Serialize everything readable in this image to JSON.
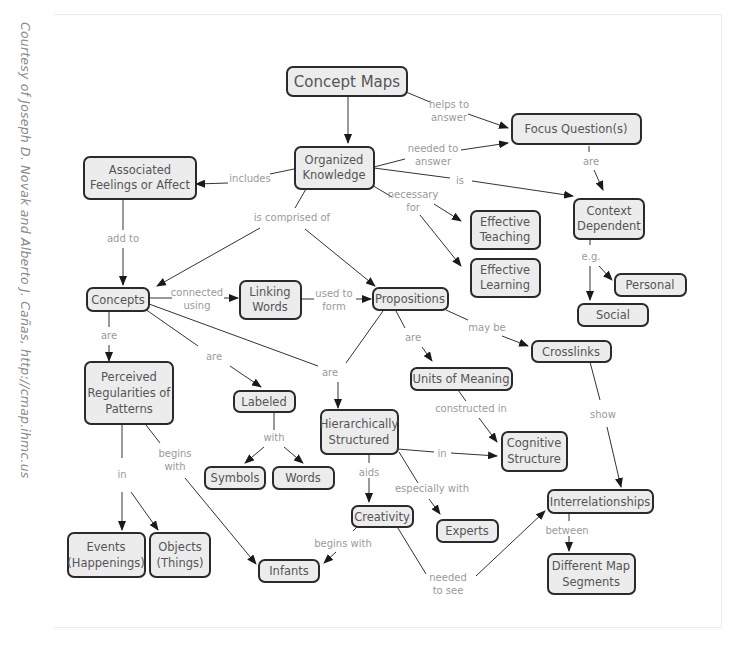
{
  "credit": "Courtesy of Joseph D. Novak and Alberto J. Cañas, http://cmap.ihmc.us",
  "nodes": {
    "concept_maps": [
      "Concept Maps"
    ],
    "focus_questions": [
      "Focus Question(s)"
    ],
    "organized_knowledge": [
      "Organized",
      "Knowledge"
    ],
    "associated_feelings": [
      "Associated",
      "Feelings or Affect"
    ],
    "context_dependent": [
      "Context",
      "Dependent"
    ],
    "effective_teaching": [
      "Effective",
      "Teaching"
    ],
    "effective_learning": [
      "Effective",
      "Learning"
    ],
    "personal": [
      "Personal"
    ],
    "social": [
      "Social"
    ],
    "concepts": [
      "Concepts"
    ],
    "linking_words": [
      "Linking",
      "Words"
    ],
    "propositions": [
      "Propositions"
    ],
    "crosslinks": [
      "Crosslinks"
    ],
    "perceived_regularities": [
      "Perceived",
      "Regularities of",
      "Patterns"
    ],
    "labeled": [
      "Labeled"
    ],
    "units_of_meaning": [
      "Units of Meaning"
    ],
    "hierarchically_structured": [
      "Hierarchically",
      "Structured"
    ],
    "cognitive_structure": [
      "Cognitive",
      "Structure"
    ],
    "symbols": [
      "Symbols"
    ],
    "words": [
      "Words"
    ],
    "interrelationships": [
      "Interrelationships"
    ],
    "creativity": [
      "Creativity"
    ],
    "experts": [
      "Experts"
    ],
    "events": [
      "Events",
      "(Happenings)"
    ],
    "objects": [
      "Objects",
      "(Things)"
    ],
    "infants": [
      "Infants"
    ],
    "different_map_segments": [
      "Different Map",
      "Segments"
    ]
  },
  "links": {
    "helps_to_answer": [
      "helps to",
      "answer"
    ],
    "needed_to_answer": [
      "needed to",
      "answer"
    ],
    "includes": [
      "includes"
    ],
    "is": [
      "is"
    ],
    "are_focus": [
      "are"
    ],
    "necessary_for": [
      "necessary",
      "for"
    ],
    "is_comprised_of": [
      "is comprised of"
    ],
    "add_to": [
      "add to"
    ],
    "eg": [
      "e.g."
    ],
    "connected_using": [
      "connected",
      "using"
    ],
    "used_to_form": [
      "used to",
      "form"
    ],
    "may_be": [
      "may be"
    ],
    "are_concepts": [
      "are"
    ],
    "are_labeled": [
      "are"
    ],
    "are_hier": [
      "are"
    ],
    "are_props": [
      "are"
    ],
    "show": [
      "show"
    ],
    "with": [
      "with"
    ],
    "constructed_in": [
      "constructed in"
    ],
    "in_cog": [
      "in"
    ],
    "in_patterns": [
      "in"
    ],
    "begins_with_patterns": [
      "begins",
      "with"
    ],
    "aids": [
      "aids"
    ],
    "especially_with": [
      "especially with"
    ],
    "between": [
      "between"
    ],
    "begins_with_creativity": [
      "begins with"
    ],
    "needed_to_see": [
      "needed",
      "to see"
    ]
  }
}
